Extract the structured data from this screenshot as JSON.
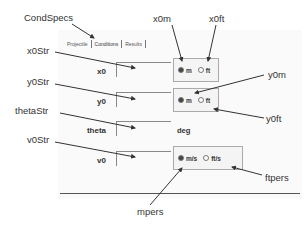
{
  "tabs": [
    {
      "label": "Projectile",
      "active": false
    },
    {
      "label": "Conditions",
      "active": true
    },
    {
      "label": "Results",
      "active": false
    }
  ],
  "fields": [
    {
      "label": "x0",
      "units": [
        "m",
        "ft"
      ],
      "selected": "m"
    },
    {
      "label": "y0",
      "units": [
        "m",
        "ft"
      ],
      "selected": "m"
    },
    {
      "label": "theta",
      "unit_text": "deg"
    },
    {
      "label": "v0",
      "units": [
        "m/s",
        "ft/s"
      ],
      "selected": "m/s"
    }
  ],
  "callouts": {
    "tab_container": "CondSpecs",
    "x0_field": "x0Str",
    "y0_field": "y0Str",
    "theta_field": "thetaStr",
    "v0_field": "v0Str",
    "x0_m": "x0m",
    "x0_ft": "x0ft",
    "y0_m": "y0m",
    "y0_ft": "y0ft",
    "v0_mps": "mpers",
    "v0_ftps": "ftpers"
  }
}
